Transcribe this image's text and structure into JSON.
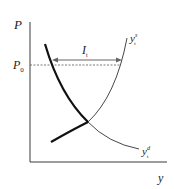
{
  "diagram": {
    "axes": {
      "y_label": "P",
      "x_label": "y"
    },
    "price_level": {
      "label": "P",
      "subscript": "0"
    },
    "gap": {
      "label": "I",
      "subscript": "t"
    },
    "curves": {
      "supply": {
        "label": "y",
        "superscript": "s",
        "subscript": "t"
      },
      "demand": {
        "label": "y",
        "superscript": "d",
        "subscript": "t"
      }
    },
    "colors": {
      "axis": "#3a3a3a",
      "thick_curve": "#111111",
      "thin_curve": "#333333",
      "dashed": "#555555",
      "arrow": "#666666"
    }
  }
}
